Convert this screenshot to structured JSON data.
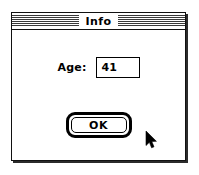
{
  "window": {
    "title": "Info",
    "title_bar_style": "striped"
  },
  "form": {
    "fields": [
      {
        "label": "Age:",
        "value": "41",
        "placeholder": ""
      }
    ]
  },
  "buttons": [
    {
      "label": "OK",
      "is_default": true
    }
  ],
  "cursor": {
    "icon": "arrow-pointer-icon",
    "x": 145,
    "y": 131
  },
  "colors": {
    "window_background": "#ffffff",
    "border": "#000000",
    "text": "#000000",
    "title_stripe": "#3a3a3a",
    "desktop_background": "#ffffff"
  }
}
